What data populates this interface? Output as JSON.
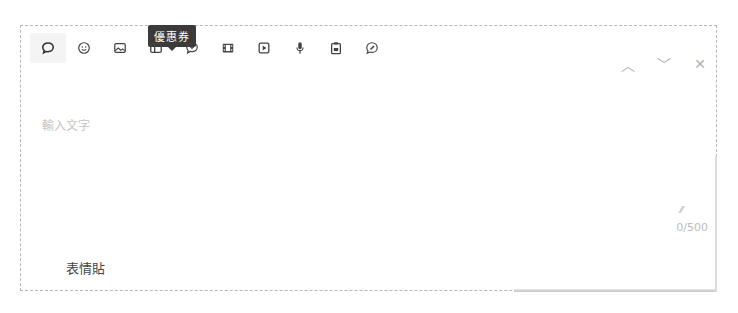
{
  "toolbar": {
    "tooltip": "優惠券",
    "items": [
      {
        "icon": "comment-icon",
        "label": "留言",
        "active": true
      },
      {
        "icon": "emoji-icon"
      },
      {
        "icon": "image-icon"
      },
      {
        "icon": "coupon-icon",
        "tooltip": "優惠券"
      },
      {
        "icon": "add-reply-icon"
      },
      {
        "icon": "video-film-icon"
      },
      {
        "icon": "play-video-icon"
      },
      {
        "icon": "microphone-icon"
      },
      {
        "icon": "clipboard-icon"
      },
      {
        "icon": "edit-bubble-icon"
      }
    ]
  },
  "nav": {
    "up": "︿",
    "down": "﹀",
    "close": "✕"
  },
  "input": {
    "placeholder": "輸入文字",
    "value": ""
  },
  "counter": "0/500",
  "resize_glyph": "⁄⁄",
  "sticker_section": {
    "label": "表情貼"
  }
}
